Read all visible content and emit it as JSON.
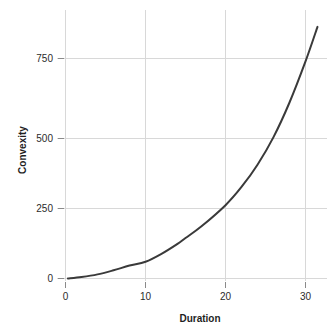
{
  "chart_data": {
    "type": "line",
    "title": "",
    "subtitle": "",
    "xlabel": "Duration",
    "ylabel": "Convexity",
    "xlim": [
      -0.8,
      32.5
    ],
    "ylim": [
      -35,
      900
    ],
    "xticks": [
      0,
      10,
      20,
      30
    ],
    "xtick_labels": [
      "0",
      "10",
      "20",
      "30"
    ],
    "yticks": [
      0,
      250,
      500,
      750
    ],
    "ytick_labels": [
      "0",
      "250",
      "500",
      "750"
    ],
    "grid": true,
    "grid_color": "#d8d8d8",
    "legend": false,
    "legend_position": "none",
    "series": [
      {
        "name": "Convexity vs Duration",
        "color": "#3a3a3a",
        "line_width": 2,
        "x": [
          0.3,
          2,
          4,
          6,
          8,
          10,
          12,
          14,
          15,
          17,
          20,
          22,
          24,
          26,
          28,
          30,
          31.5
        ],
        "y": [
          0,
          5,
          14,
          28,
          44,
          57,
          84,
          118,
          138,
          178,
          250,
          312,
          388,
          482,
          600,
          740,
          858
        ]
      }
    ],
    "annotations": []
  },
  "axes": {
    "x_title": "Duration",
    "y_title": "Convexity"
  },
  "ticks": {
    "x": [
      "0",
      "10",
      "20",
      "30"
    ],
    "y": [
      "0",
      "250",
      "500",
      "750"
    ]
  },
  "colors": {
    "line": "#3a3a3a",
    "grid": "#d8d8d8",
    "text": "#2b2b2b",
    "background": "#ffffff"
  }
}
